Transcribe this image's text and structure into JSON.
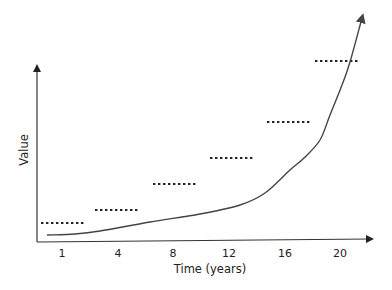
{
  "chart_data": {
    "type": "line",
    "title": "",
    "xlabel": "Time (years)",
    "ylabel": "Value",
    "x_ticks": [
      "1",
      "4",
      "8",
      "12",
      "16",
      "20"
    ],
    "grid": false,
    "legend": null,
    "y_tick_labels": [],
    "series": [
      {
        "name": "exponential-growth-curve",
        "style": "solid-with-arrowhead",
        "color": "#444444",
        "points_px": [
          [
            47,
            235
          ],
          [
            75,
            234
          ],
          [
            100,
            231
          ],
          [
            150,
            222
          ],
          [
            200,
            214
          ],
          [
            240,
            205
          ],
          [
            265,
            193
          ],
          [
            290,
            170
          ],
          [
            304,
            158
          ],
          [
            320,
            140
          ],
          [
            330,
            115
          ],
          [
            342,
            85
          ],
          [
            350,
            62
          ],
          [
            362,
            18
          ]
        ]
      },
      {
        "name": "step-levels",
        "style": "dotted",
        "color": "#222222",
        "segments_px": [
          {
            "x1": 41,
            "x2": 85,
            "y": 223
          },
          {
            "x1": 95,
            "x2": 140,
            "y": 210
          },
          {
            "x1": 153,
            "x2": 198,
            "y": 184
          },
          {
            "x1": 210,
            "x2": 255,
            "y": 158
          },
          {
            "x1": 267,
            "x2": 312,
            "y": 122
          },
          {
            "x1": 315,
            "x2": 360,
            "y": 61
          }
        ]
      }
    ],
    "annotations": []
  },
  "labels": {
    "xlabel": "Time (years)",
    "ylabel": "Value",
    "ticks": [
      "1",
      "4",
      "8",
      "12",
      "16",
      "20"
    ]
  },
  "colors": {
    "axis": "#333333",
    "curve": "#444444",
    "dots": "#222222",
    "text": "#222222"
  }
}
